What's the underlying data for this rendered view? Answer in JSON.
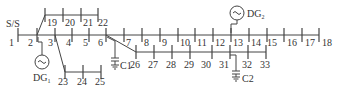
{
  "source_label": "S/S",
  "colors": {
    "line": "#444444",
    "text": "#333333",
    "background": "#ffffff"
  },
  "buses": [
    {
      "id": "1",
      "label": "1",
      "x": 18,
      "y": 35,
      "lx": 9,
      "ly": 46
    },
    {
      "id": "2",
      "label": "2",
      "x": 37,
      "y": 35,
      "lx": 28,
      "ly": 46
    },
    {
      "id": "3",
      "label": "3",
      "x": 55,
      "y": 35,
      "lx": 48,
      "ly": 46
    },
    {
      "id": "4",
      "label": "4",
      "x": 72,
      "y": 35,
      "lx": 66,
      "ly": 46
    },
    {
      "id": "5",
      "label": "5",
      "x": 89,
      "y": 35,
      "lx": 83,
      "ly": 46
    },
    {
      "id": "6",
      "label": "6",
      "x": 106,
      "y": 35,
      "lx": 98,
      "ly": 46
    },
    {
      "id": "7",
      "label": "7",
      "x": 124,
      "y": 35,
      "lx": 126,
      "ly": 46
    },
    {
      "id": "8",
      "label": "8",
      "x": 142,
      "y": 35,
      "lx": 144,
      "ly": 46
    },
    {
      "id": "9",
      "label": "9",
      "x": 160,
      "y": 35,
      "lx": 162,
      "ly": 46
    },
    {
      "id": "10",
      "label": "10",
      "x": 178,
      "y": 35,
      "lx": 180,
      "ly": 46
    },
    {
      "id": "11",
      "label": "11",
      "x": 195,
      "y": 35,
      "lx": 197,
      "ly": 46
    },
    {
      "id": "12",
      "label": "12",
      "x": 213,
      "y": 35,
      "lx": 215,
      "ly": 46
    },
    {
      "id": "13",
      "label": "13",
      "x": 231,
      "y": 35,
      "lx": 233,
      "ly": 46
    },
    {
      "id": "14",
      "label": "14",
      "x": 249,
      "y": 35,
      "lx": 251,
      "ly": 46
    },
    {
      "id": "15",
      "label": "15",
      "x": 267,
      "y": 35,
      "lx": 267,
      "ly": 46
    },
    {
      "id": "16",
      "label": "16",
      "x": 284,
      "y": 35,
      "lx": 287,
      "ly": 46
    },
    {
      "id": "17",
      "label": "17",
      "x": 302,
      "y": 35,
      "lx": 305,
      "ly": 46
    },
    {
      "id": "18",
      "label": "18",
      "x": 319,
      "y": 35,
      "lx": 322,
      "ly": 46
    },
    {
      "id": "19",
      "label": "19",
      "x": 45,
      "y": 15,
      "lx": 47,
      "ly": 26
    },
    {
      "id": "20",
      "label": "20",
      "x": 63,
      "y": 15,
      "lx": 65,
      "ly": 26
    },
    {
      "id": "21",
      "label": "21",
      "x": 81,
      "y": 15,
      "lx": 83,
      "ly": 26
    },
    {
      "id": "22",
      "label": "22",
      "x": 98,
      "y": 15,
      "lx": 98,
      "ly": 26
    },
    {
      "id": "23",
      "label": "23",
      "x": 65,
      "y": 72,
      "lx": 58,
      "ly": 85
    },
    {
      "id": "24",
      "label": "24",
      "x": 83,
      "y": 72,
      "lx": 77,
      "ly": 85
    },
    {
      "id": "25",
      "label": "25",
      "x": 101,
      "y": 72,
      "lx": 95,
      "ly": 85
    },
    {
      "id": "26",
      "label": "26",
      "x": 136,
      "y": 52,
      "lx": 130,
      "ly": 68
    },
    {
      "id": "27",
      "label": "27",
      "x": 154,
      "y": 52,
      "lx": 148,
      "ly": 68
    },
    {
      "id": "28",
      "label": "28",
      "x": 172,
      "y": 52,
      "lx": 166,
      "ly": 68
    },
    {
      "id": "29",
      "label": "29",
      "x": 190,
      "y": 52,
      "lx": 184,
      "ly": 68
    },
    {
      "id": "30",
      "label": "30",
      "x": 212,
      "y": 52,
      "lx": 201,
      "ly": 68
    },
    {
      "id": "31",
      "label": "31",
      "x": 230,
      "y": 52,
      "lx": 219,
      "ly": 68
    },
    {
      "id": "32",
      "label": "32",
      "x": 248,
      "y": 52,
      "lx": 242,
      "ly": 68
    },
    {
      "id": "33",
      "label": "33",
      "x": 266,
      "y": 52,
      "lx": 260,
      "ly": 68
    }
  ],
  "generators": [
    {
      "id": "DG1",
      "label": "DG",
      "subscript": "1",
      "bus": "2",
      "cx": 42,
      "cy": 62,
      "r": 7,
      "lx": 33,
      "ly": 81
    },
    {
      "id": "DG2",
      "label": "DG",
      "subscript": "2",
      "bus": "13",
      "cx": 237,
      "cy": 13,
      "r": 7,
      "lx": 247,
      "ly": 17
    }
  ],
  "capacitors": [
    {
      "id": "C1",
      "label": "C1",
      "bus": "6",
      "x": 115,
      "y": 58,
      "lx": 120,
      "ly": 69
    },
    {
      "id": "C2",
      "label": "C2",
      "bus": "31",
      "x": 236,
      "y": 72,
      "lx": 242,
      "ly": 82
    }
  ]
}
